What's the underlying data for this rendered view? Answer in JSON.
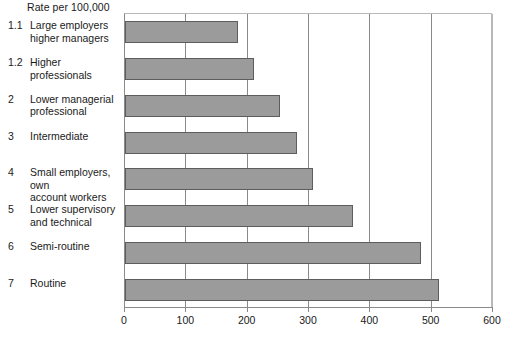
{
  "chart_data": {
    "type": "bar",
    "orientation": "horizontal",
    "title": "",
    "subtitle": "",
    "axis_caption": "Rate per 100,000",
    "xlabel": "",
    "ylabel": "",
    "xlim": [
      0,
      600
    ],
    "xticks": [
      0,
      100,
      200,
      300,
      400,
      500,
      600
    ],
    "xtick_labels": [
      "0",
      "100",
      "200",
      "300",
      "400",
      "500",
      "600"
    ],
    "grid": true,
    "grid_axis": "x",
    "legend": false,
    "legend_position": "none",
    "bar_fill_color": "#9b9b9b",
    "bar_edge_color": "#5d5d5d",
    "categories": [
      "Large employers higher managers",
      "Higher professionals",
      "Lower managerial professional",
      "Intermediate",
      "Small employers, own account workers",
      "Lower supervisory and technical",
      "Semi-routine",
      "Routine"
    ],
    "category_codes": [
      "1.1",
      "1.2",
      "2",
      "3",
      "4",
      "5",
      "6",
      "7"
    ],
    "values": [
      184,
      210,
      253,
      281,
      306,
      372,
      483,
      512
    ]
  },
  "rows": [
    {
      "code": "1.1",
      "label_lines": [
        "Large employers",
        "higher managers"
      ],
      "label": "Large employers higher managers",
      "value": 184
    },
    {
      "code": "1.2",
      "label_lines": [
        "Higher professionals"
      ],
      "label": "Higher professionals",
      "value": 210
    },
    {
      "code": "2",
      "label_lines": [
        "Lower managerial",
        "professional"
      ],
      "label": "Lower managerial professional",
      "value": 253
    },
    {
      "code": "3",
      "label_lines": [
        "Intermediate"
      ],
      "label": "Intermediate",
      "value": 281
    },
    {
      "code": "4",
      "label_lines": [
        "Small employers, own",
        "account workers"
      ],
      "label": "Small employers, own account workers",
      "value": 306
    },
    {
      "code": "5",
      "label_lines": [
        "Lower supervisory",
        "and technical"
      ],
      "label": "Lower supervisory and technical",
      "value": 372
    },
    {
      "code": "6",
      "label_lines": [
        "Semi-routine"
      ],
      "label": "Semi-routine",
      "value": 483
    },
    {
      "code": "7",
      "label_lines": [
        "Routine"
      ],
      "label": "Routine",
      "value": 512
    }
  ],
  "axis": {
    "caption": "Rate per 100,000",
    "ticks": [
      "0",
      "100",
      "200",
      "300",
      "400",
      "500",
      "600"
    ]
  }
}
